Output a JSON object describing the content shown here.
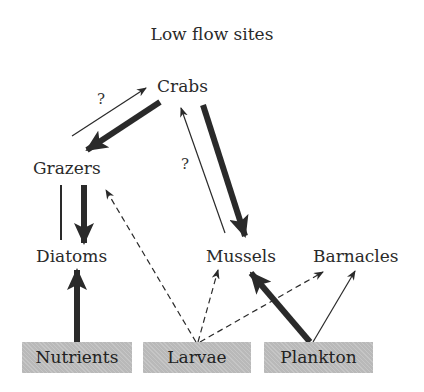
{
  "title": "Low flow sites",
  "nodes": {
    "crabs": "Crabs",
    "grazers": "Grazers",
    "diatoms": "Diatoms",
    "mussels": "Mussels",
    "barnacles": "Barnacles"
  },
  "sources": {
    "nutrients": "Nutrients",
    "larvae": "Larvae",
    "plankton": "Plankton"
  },
  "uncertain_marks": {
    "grazers_to_crabs": "?",
    "mussels_to_crabs": "?"
  },
  "edges": [
    {
      "from": "Grazers",
      "to": "Crabs",
      "style": "thin",
      "label": "?"
    },
    {
      "from": "Crabs",
      "to": "Grazers",
      "style": "thick"
    },
    {
      "from": "Mussels",
      "to": "Crabs",
      "style": "thin",
      "label": "?"
    },
    {
      "from": "Crabs",
      "to": "Mussels",
      "style": "thick"
    },
    {
      "from": "Diatoms",
      "to": "Grazers",
      "style": "thin-line"
    },
    {
      "from": "Grazers",
      "to": "Diatoms",
      "style": "thick"
    },
    {
      "from": "Nutrients",
      "to": "Diatoms",
      "style": "thick"
    },
    {
      "from": "Larvae",
      "to": "Grazers",
      "style": "dashed"
    },
    {
      "from": "Larvae",
      "to": "Mussels",
      "style": "dashed"
    },
    {
      "from": "Larvae",
      "to": "Barnacles",
      "style": "dashed"
    },
    {
      "from": "Plankton",
      "to": "Mussels",
      "style": "thick"
    },
    {
      "from": "Plankton",
      "to": "Barnacles",
      "style": "thin"
    }
  ],
  "colors": {
    "ink": "#2a2a2a",
    "box_fill": "#b9b9b9"
  }
}
